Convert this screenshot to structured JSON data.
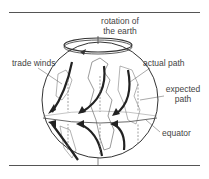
{
  "figure": {
    "labels": {
      "rotation_line1": "rotation of",
      "rotation_line2": "the earth",
      "trade_winds": "trade winds",
      "actual_path": "actual path",
      "expected_line1": "expected",
      "expected_line2": "path",
      "equator": "equator"
    },
    "icons": {
      "globe": "globe-icon",
      "rotation_ring": "rotation-ring-icon",
      "actual_arrows": "curved-arrow-icon",
      "expected_arrows": "straight-dashed-arrow-icon"
    }
  }
}
